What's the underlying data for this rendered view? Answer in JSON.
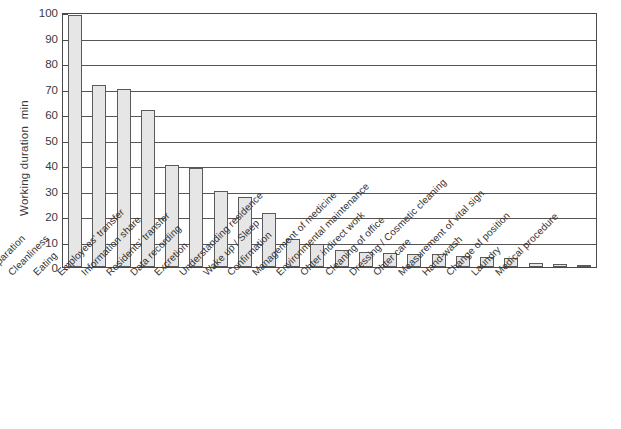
{
  "chart_data": {
    "type": "bar",
    "title": "",
    "xlabel": "",
    "ylabel": "Working duration  min",
    "ylim": [
      0,
      100
    ],
    "ytick_step": 10,
    "yticks": [
      100,
      90,
      80,
      70,
      60,
      50,
      40,
      30,
      20,
      10,
      0
    ],
    "grid": true,
    "legend": null,
    "orientation": "vertical",
    "bar_color": "#e6e6e6",
    "bar_edge_color": "#5a5a5a",
    "axis_color": "#4a4a4a",
    "xtick_rotation_deg": -45,
    "categories": [
      "Preparation",
      "Cleanliness",
      "Eating",
      "Employees' transfer",
      "Information share",
      "Residents' transfer",
      "Data recording",
      "Excretion",
      "Understanding residence",
      "Wake up / Sleep",
      "Confirmation",
      "Management of medicine",
      "Environmental maintenance",
      "Ohter indirect work",
      "Cleaning of office",
      "Dressing / Cosmetic cleaning",
      "Ohter care",
      "Measurement of vital sign",
      "Hand-wash",
      "Change of position",
      "Laundry",
      "Medical procedure"
    ],
    "values": [
      99,
      71.5,
      70,
      61.5,
      40,
      39,
      30,
      27.5,
      21,
      11,
      9,
      6.5,
      6,
      5.5,
      5,
      5,
      4.5,
      4,
      3.5,
      1.5,
      1,
      0.8
    ],
    "units": "min"
  }
}
